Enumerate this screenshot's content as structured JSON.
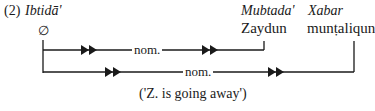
{
  "example_number": "(2)",
  "nodes": [
    {
      "id": "ibtida",
      "role": "Ibtidā'",
      "value": "∅"
    },
    {
      "id": "mubtada",
      "role": "Mubtada'",
      "value": "Zaydun"
    },
    {
      "id": "xabar",
      "role": "Xabar",
      "value": "munṭaliqun"
    }
  ],
  "edges": [
    {
      "from": "ibtida",
      "to": "mubtada",
      "label": "nom."
    },
    {
      "from": "ibtida",
      "to": "xabar",
      "label": "nom."
    }
  ],
  "translation": "('Z. is going away')"
}
